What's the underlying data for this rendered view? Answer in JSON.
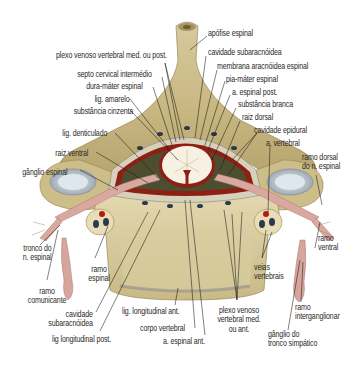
{
  "figure": {
    "type": "anatomical illustration",
    "colors": {
      "background": "#ffffff",
      "bone": "#cfc08e",
      "bone_dark": "#9c8a55",
      "cord_white_matter": "#f6f1e3",
      "meninges_red": "#8e1f14",
      "nerve": "#d9a9a0",
      "ganglion": "#c8d0d8",
      "label_text": "#2a2a2a",
      "leader_line": "#1a1a1a"
    }
  },
  "labels": {
    "apofise_espinal": "apófise espinal",
    "cavidade_subaracnoidea_top": "cavidade subaracnóidea",
    "membrana_aracnoidea": "membrana aracnóidea espinal",
    "pia_mater": "pia-máter espinal",
    "a_espinal_post": "a. espinal post.",
    "substancia_branca": "substância branca",
    "raiz_dorsal": "raiz dorsal",
    "cavidade_epidural": "cavidade epidural",
    "a_vertebral": "a. vertebral",
    "ramo_dorsal": [
      "ramo dorsal",
      "do n. espinal"
    ],
    "ramo_ventral": [
      "ramo",
      "ventral"
    ],
    "plexo_post": "plexo venoso vertebral med. ou post.",
    "septo_cervical": "septo cervical intermédio",
    "dura_mater": "dura-máter espinal",
    "lig_amarelo": "lig. amarelo",
    "substancia_cinzenta": "substância cinzenta",
    "lig_denticulado": "lig. denticulado",
    "raiz_ventral": "raiz ventral",
    "ganglio_espinal": "gânglio espinal",
    "tronco_n_espinal": [
      "tronco do",
      "n. espinal"
    ],
    "ramo_espinal": [
      "ramo",
      "espinal"
    ],
    "ramo_comunicante": [
      "ramo",
      "comunicante"
    ],
    "cavidade_subaracnoidea_bottom": [
      "cavidade",
      "subaracnóidea"
    ],
    "lig_longitudinal_post": "lig longitudinal post.",
    "lig_longitudinal_ant": "lig. longitudinal ant.",
    "corpo_vertebral": "corpo vertebral",
    "a_espinal_ant": "a. espinal ant.",
    "plexo_ant": [
      "plexo venoso",
      "vertebral med.",
      "ou ant."
    ],
    "veias_vertebrais": [
      "veias",
      "vertebrais"
    ],
    "ramo_interganglionar": [
      "ramo",
      "interganglionar"
    ],
    "ganglio_tronco_simpatico": [
      "gânglio do",
      "tronco simpático"
    ]
  }
}
